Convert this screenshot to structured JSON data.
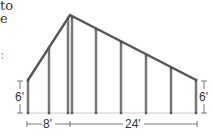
{
  "text_fragments": [
    {
      "text": "to",
      "x": 0,
      "y": -1
    },
    {
      "text": "e",
      "x": 0,
      "y": 12
    },
    {
      "text": ":",
      "x": 0,
      "y": 48
    }
  ],
  "diagram": {
    "colors": {
      "frame": "#555555",
      "frame_light": "#bdbdbd",
      "dimension": "#444444"
    },
    "dimensions": {
      "left_wall_height": "6'",
      "right_wall_height": "6'",
      "left_width": "8'",
      "right_width": "24'"
    },
    "stud_x": [
      28,
      49,
      70,
      96,
      121,
      146,
      171,
      196
    ],
    "base_y": 113,
    "eave_y": 80,
    "peak": {
      "x": 70,
      "y": 15
    }
  }
}
